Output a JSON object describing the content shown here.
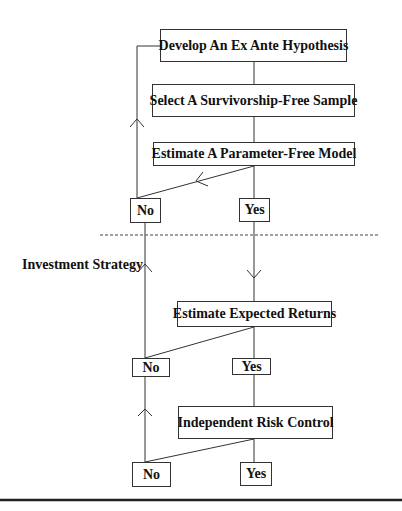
{
  "diagram": {
    "type": "flowchart",
    "section_label": "Investment Strategy",
    "nodes": {
      "hypothesis": "Develop An Ex Ante Hypothesis",
      "sample": "Select A Survivorship-Free Sample",
      "model": "Estimate A Parameter-Free Model",
      "model_no": "No",
      "model_yes": "Yes",
      "returns": "Estimate Expected Returns",
      "returns_no": "No",
      "returns_yes": "Yes",
      "risk": "Independent Risk Control",
      "risk_no": "No",
      "risk_yes": "Yes"
    },
    "edges": [
      {
        "from": "Develop An Ex Ante Hypothesis",
        "to": "Select A Survivorship-Free Sample"
      },
      {
        "from": "Select A Survivorship-Free Sample",
        "to": "Estimate A Parameter-Free Model"
      },
      {
        "from": "Estimate A Parameter-Free Model",
        "to": "No (model)"
      },
      {
        "from": "Estimate A Parameter-Free Model",
        "to": "Yes (model)"
      },
      {
        "from": "No (model)",
        "to": "Develop An Ex Ante Hypothesis"
      },
      {
        "from": "Yes (model)",
        "to": "Estimate Expected Returns"
      },
      {
        "from": "Estimate Expected Returns",
        "to": "No (returns)"
      },
      {
        "from": "Estimate Expected Returns",
        "to": "Yes (returns)"
      },
      {
        "from": "No (returns)",
        "to": "No (model)"
      },
      {
        "from": "Yes (returns)",
        "to": "Independent Risk Control"
      },
      {
        "from": "Independent Risk Control",
        "to": "No (risk)"
      },
      {
        "from": "Independent Risk Control",
        "to": "Yes (risk)"
      },
      {
        "from": "No (risk)",
        "to": "No (returns)"
      }
    ],
    "colors": {
      "line": "#333333",
      "text": "#111111",
      "background": "#ffffff"
    }
  }
}
